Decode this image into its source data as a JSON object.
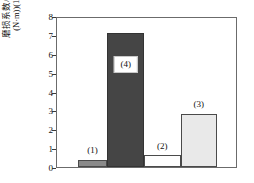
{
  "chart_data": {
    "type": "bar",
    "title": "",
    "xlabel": "",
    "ylabel_line1": "磨损系数/(mm³/",
    "ylabel_line2": "(N·m))(10⁻⁴)",
    "ylabel_full": "磨损系数/(mm³/(N·m))(10⁻⁴)",
    "ylim": [
      0,
      8
    ],
    "yticks": [
      "0",
      "1",
      "2",
      "3",
      "4",
      "5",
      "6",
      "7",
      "8"
    ],
    "ytick_values": [
      0,
      1,
      2,
      3,
      4,
      5,
      6,
      7,
      8
    ],
    "grid": false,
    "legend": "none",
    "xtick_labels": [],
    "categories": [
      "(1)",
      "(4)",
      "(2)",
      "(3)"
    ],
    "values": [
      0.38,
      7.17,
      0.62,
      2.86
    ],
    "bars": [
      {
        "label": "(1)",
        "value": 0.38,
        "color": "#8a8a8a",
        "edge": "#4a4a4a",
        "label_boxed": false,
        "left_pct": 11.6,
        "width_pct": 16.6,
        "label_center_pct": 19.9,
        "label_bottom_value": 0.62
      },
      {
        "label": "(4)",
        "value": 7.17,
        "color": "#454545",
        "edge": "#333333",
        "label_boxed": true,
        "left_pct": 28.2,
        "width_pct": 20.4,
        "label_center_pct": 38.4,
        "label_bottom_value": 5.05
      },
      {
        "label": "(2)",
        "value": 0.62,
        "color": "#fdfdfd",
        "edge": "#4a4a4a",
        "label_boxed": false,
        "left_pct": 48.6,
        "width_pct": 20.4,
        "label_center_pct": 58.8,
        "label_bottom_value": 0.85
      },
      {
        "label": "(3)",
        "value": 2.86,
        "color": "#e9e9e9",
        "edge": "#4a4a4a",
        "label_boxed": false,
        "left_pct": 69.0,
        "width_pct": 20.4,
        "label_center_pct": 79.2,
        "label_bottom_value": 3.1
      }
    ],
    "colors": {
      "axis": "#6b6b6b",
      "text": "#111111",
      "background": "#ffffff"
    }
  }
}
